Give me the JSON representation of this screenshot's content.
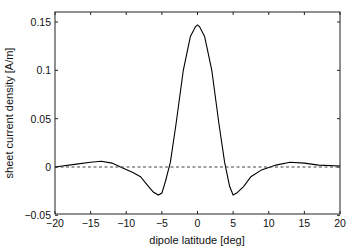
{
  "chart_data": {
    "type": "line",
    "title": "",
    "xlabel": "dipole latitude [deg]",
    "ylabel": "sheet current density [A/m]",
    "xlim": [
      -20,
      20
    ],
    "ylim": [
      -0.05,
      0.16
    ],
    "xticks": [
      -20,
      -15,
      -10,
      -5,
      0,
      5,
      10,
      15,
      20
    ],
    "xtick_labels": [
      "−20",
      "−15",
      "−10",
      "−5",
      "0",
      "5",
      "10",
      "15",
      "20"
    ],
    "yticks": [
      -0.05,
      0,
      0.05,
      0.1,
      0.15
    ],
    "ytick_labels": [
      "−0.05",
      "0",
      "0.05",
      "0.1",
      "0.15"
    ],
    "grid": false,
    "legend": null,
    "series": [
      {
        "name": "sheet current density",
        "style": "solid",
        "color": "#000000",
        "x": [
          -20,
          -17,
          -15,
          -13.5,
          -12,
          -10.5,
          -9,
          -8,
          -7,
          -6.2,
          -5.5,
          -5,
          -4.5,
          -3.8,
          -3,
          -2,
          -1,
          -0.3,
          0,
          0.3,
          1,
          2,
          3,
          3.8,
          4.5,
          5,
          5.5,
          6.5,
          7.5,
          9,
          11,
          13,
          15,
          17,
          20
        ],
        "y": [
          0.0,
          0.003,
          0.005,
          0.006,
          0.004,
          -0.001,
          -0.006,
          -0.01,
          -0.019,
          -0.026,
          -0.029,
          -0.027,
          -0.015,
          0.005,
          0.045,
          0.1,
          0.135,
          0.145,
          0.147,
          0.145,
          0.135,
          0.1,
          0.045,
          0.005,
          -0.02,
          -0.029,
          -0.027,
          -0.02,
          -0.01,
          -0.003,
          0.002,
          0.005,
          0.004,
          0.002,
          0.001
        ]
      },
      {
        "name": "zero line",
        "style": "dashed",
        "color": "#000000",
        "x": [
          -20,
          20
        ],
        "y": [
          0,
          0
        ]
      }
    ]
  }
}
